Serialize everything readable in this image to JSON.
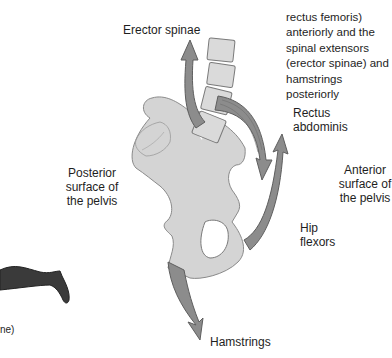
{
  "figure": {
    "caption_lines": [
      "(iliopsoas and",
      "rectus femoris)",
      "anteriorly and the",
      "spinal extensors",
      "(erector spinae) and",
      "hamstrings",
      "posteriorly"
    ],
    "labels": {
      "erector_spinae": "Erector spinae",
      "rectus_abdominis_1": "Rectus",
      "rectus_abdominis_2": "abdominis",
      "posterior_1": "Posterior",
      "posterior_2": "surface of",
      "posterior_3": "the pelvis",
      "anterior_1": "Anterior",
      "anterior_2": "surface of",
      "anterior_3": "the pelvis",
      "hip_flexors_1": "Hip",
      "hip_flexors_2": "flexors",
      "hamstrings": "Hamstrings",
      "left_fragment": "ne)"
    },
    "colors": {
      "bone": "#d4d4d4",
      "bone_outline": "#8a8a8a",
      "arrow": "#8c8c8c",
      "arrow_outline": "#5e5e5e",
      "vertebra": "#dadada",
      "leg_silhouette": "#3a3a3a",
      "text": "#1e1e1e"
    }
  }
}
